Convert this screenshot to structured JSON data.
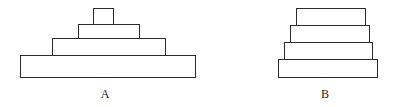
{
  "canvas": {
    "width": 402,
    "height": 107,
    "background": "#ffffff",
    "stroke_color": "#2b2b2b",
    "fill_color": "#ffffff",
    "stroke_width": 1
  },
  "figures": [
    {
      "id": "figure-a",
      "label": "A",
      "label_x": 105,
      "label_y": 88,
      "tier_count": 4,
      "tiers": [
        {
          "name": "tier-top",
          "x": 93,
          "y": 8,
          "width": 21,
          "height": 17
        },
        {
          "name": "tier-second",
          "x": 78,
          "y": 24,
          "width": 62,
          "height": 15
        },
        {
          "name": "tier-third",
          "x": 52,
          "y": 38,
          "width": 114,
          "height": 18
        },
        {
          "name": "tier-base",
          "x": 20,
          "y": 55,
          "width": 176,
          "height": 23
        }
      ]
    },
    {
      "id": "figure-b",
      "label": "B",
      "label_x": 325,
      "label_y": 88,
      "tier_count": 4,
      "tiers": [
        {
          "name": "tier-top",
          "x": 296,
          "y": 8,
          "width": 70,
          "height": 18
        },
        {
          "name": "tier-second",
          "x": 290,
          "y": 25,
          "width": 80,
          "height": 18
        },
        {
          "name": "tier-third",
          "x": 284,
          "y": 42,
          "width": 89,
          "height": 18
        },
        {
          "name": "tier-base",
          "x": 278,
          "y": 59,
          "width": 100,
          "height": 19
        }
      ]
    }
  ]
}
